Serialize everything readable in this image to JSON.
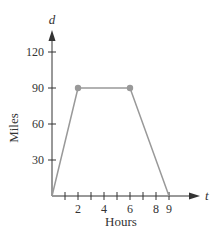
{
  "chart_data": {
    "type": "line",
    "title": "",
    "xlabel": "Hours",
    "ylabel": "Miles",
    "x_variable": "t",
    "y_variable": "d",
    "x_ticks": [
      1,
      2,
      3,
      4,
      5,
      6,
      7,
      8,
      9
    ],
    "x_tick_labels": [
      "2",
      "4",
      "6",
      "8",
      "9"
    ],
    "x_tick_label_values": [
      2,
      4,
      6,
      8,
      9
    ],
    "y_ticks": [
      30,
      60,
      90,
      120
    ],
    "y_tick_labels": [
      "30",
      "60",
      "90",
      "120"
    ],
    "xlim": [
      0,
      10
    ],
    "ylim": [
      0,
      130
    ],
    "grid": false,
    "series": [
      {
        "name": "distance",
        "x": [
          0,
          2,
          6,
          9
        ],
        "y": [
          0,
          90,
          90,
          0
        ],
        "markers_at": [
          [
            2,
            90
          ],
          [
            6,
            90
          ]
        ]
      }
    ],
    "colors": {
      "line": "#999999",
      "marker": "#999999",
      "axis": "#333333"
    }
  }
}
